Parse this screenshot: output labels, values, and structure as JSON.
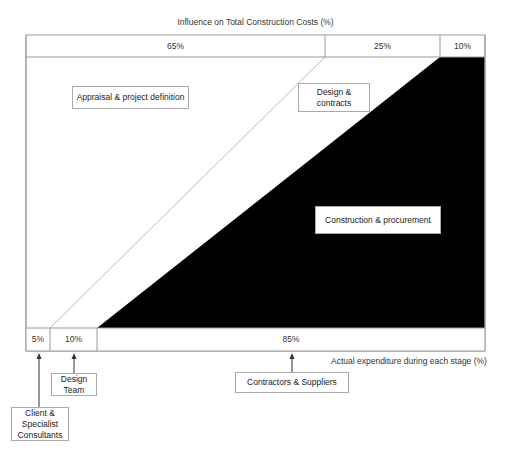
{
  "diagram": {
    "title": "Influence on Total Construction Costs (%)",
    "top_band": [
      {
        "label": "65%",
        "stage": "Appraisal & project definition"
      },
      {
        "label": "25%",
        "stage": "Design & contracts"
      },
      {
        "label": "10%",
        "stage": "Construction & procurement"
      }
    ],
    "bottom_band": [
      {
        "label": "5%"
      },
      {
        "label": "10%"
      },
      {
        "label": "85%"
      }
    ],
    "bottom_axis_label": "Actual expenditure during each stage (%)",
    "regions": {
      "appraisal": "Appraisal & project definition",
      "design": "Design & contracts",
      "construction": "Construction & procurement"
    },
    "parties": {
      "client": "Client & Specialist Consultants",
      "design_team": "Design Team",
      "contractors": "Contractors & Suppliers"
    },
    "colors": {
      "frame": "#999999",
      "diagonal": "#bbbbbb",
      "construction_fill": "#000000",
      "background": "#ffffff"
    }
  }
}
